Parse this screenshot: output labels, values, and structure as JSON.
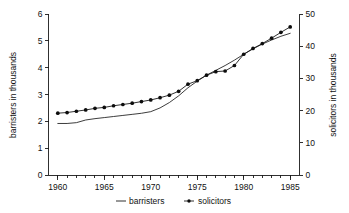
{
  "chart_data": {
    "type": "line",
    "title": "",
    "xlabel": "",
    "ylabel": "barristers in thousands",
    "y2label": "solicitors in thousands",
    "xlim": [
      1959,
      1986
    ],
    "ylim": [
      0,
      6
    ],
    "y2lim": [
      0,
      50
    ],
    "grid": false,
    "legend_position": "bottom-center",
    "x_tick_labels": [
      "1960",
      "1965",
      "1970",
      "1975",
      "1980",
      "1985"
    ],
    "x_tick_values": [
      1960,
      1965,
      1970,
      1975,
      1980,
      1985
    ],
    "x_minor_tick_interval": 1,
    "y_tick_labels": [
      "0",
      "1",
      "2",
      "3",
      "4",
      "5",
      "6"
    ],
    "y_tick_values": [
      0,
      1,
      2,
      3,
      4,
      5,
      6
    ],
    "y2_tick_labels": [
      "0",
      "10",
      "20",
      "30",
      "40",
      "50"
    ],
    "y2_tick_values": [
      0,
      10,
      20,
      30,
      40,
      50
    ],
    "x": [
      1960,
      1961,
      1962,
      1963,
      1964,
      1965,
      1966,
      1967,
      1968,
      1969,
      1970,
      1971,
      1972,
      1973,
      1974,
      1975,
      1976,
      1977,
      1978,
      1979,
      1980,
      1981,
      1982,
      1983,
      1984,
      1985
    ],
    "series": [
      {
        "name": "barristers",
        "axis": "left",
        "units": "thousands",
        "marker": "none",
        "values": [
          1.92,
          1.92,
          1.95,
          2.05,
          2.1,
          2.14,
          2.18,
          2.22,
          2.26,
          2.3,
          2.36,
          2.5,
          2.7,
          2.95,
          3.25,
          3.5,
          3.72,
          3.9,
          4.08,
          4.28,
          4.5,
          4.7,
          4.88,
          5.03,
          5.17,
          5.28
        ]
      },
      {
        "name": "solicitors",
        "axis": "right",
        "units": "thousands",
        "marker": "dot",
        "values_left_scale": [
          2.3,
          2.33,
          2.38,
          2.43,
          2.48,
          2.52,
          2.58,
          2.63,
          2.68,
          2.73,
          2.8,
          2.88,
          2.98,
          3.12,
          3.38,
          3.52,
          3.72,
          3.85,
          3.88,
          4.08,
          4.5,
          4.72,
          4.9,
          5.1,
          5.32,
          5.52
        ],
        "values": [
          19.2,
          19.4,
          19.8,
          20.2,
          20.7,
          21.0,
          21.5,
          21.9,
          22.3,
          22.8,
          23.3,
          24.0,
          24.8,
          26.0,
          28.2,
          29.3,
          31.0,
          32.1,
          32.3,
          34.0,
          37.5,
          39.3,
          40.8,
          42.5,
          44.3,
          46.0
        ]
      }
    ],
    "legend": [
      {
        "label": "barristers",
        "marker": "line"
      },
      {
        "label": "solicitors",
        "marker": "line-dot"
      }
    ],
    "colors": {
      "series_barristers": "#1a1a1a",
      "series_solicitors": "#0d0d0d",
      "axis": "#1a1a1a",
      "text": "#111111",
      "background": "#ffffff"
    }
  }
}
